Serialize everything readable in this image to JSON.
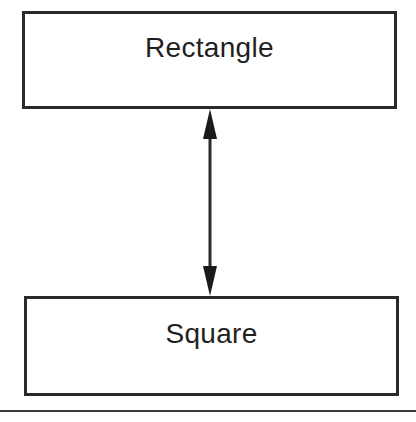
{
  "diagram": {
    "type": "class-relationship",
    "nodes": [
      {
        "id": "rectangle",
        "label": "Rectangle"
      },
      {
        "id": "square",
        "label": "Square"
      }
    ],
    "edges": [
      {
        "from": "rectangle",
        "to": "square",
        "style": "bidirectional-arrow"
      }
    ]
  },
  "colors": {
    "stroke": "#2a2a2a",
    "text": "#1f1f1f",
    "background": "#ffffff"
  }
}
